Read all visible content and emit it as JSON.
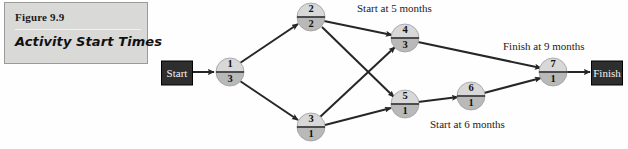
{
  "figure": {
    "number_label": "Figure 9.9",
    "title": "Activity Start Times"
  },
  "diagram": {
    "type": "activity-on-node-network",
    "terminals": [
      {
        "id": "start",
        "label": "Start",
        "x": 177,
        "y": 73,
        "width": 31,
        "height": 24
      },
      {
        "id": "finish",
        "label": "Finish",
        "x": 607,
        "y": 73,
        "width": 31,
        "height": 24
      }
    ],
    "nodes": [
      {
        "id": "n1",
        "top": "1",
        "bottom": "3",
        "cx": 230,
        "cy": 72,
        "r": 14
      },
      {
        "id": "n2",
        "top": "2",
        "bottom": "2",
        "cx": 311,
        "cy": 17,
        "r": 14
      },
      {
        "id": "n3",
        "top": "3",
        "bottom": "1",
        "cx": 311,
        "cy": 127,
        "r": 14
      },
      {
        "id": "n4",
        "top": "4",
        "bottom": "3",
        "cx": 405,
        "cy": 38,
        "r": 14
      },
      {
        "id": "n5",
        "top": "5",
        "bottom": "1",
        "cx": 405,
        "cy": 104,
        "r": 14
      },
      {
        "id": "n6",
        "top": "6",
        "bottom": "1",
        "cx": 471,
        "cy": 96,
        "r": 14
      },
      {
        "id": "n7",
        "top": "7",
        "bottom": "1",
        "cx": 553,
        "cy": 72,
        "r": 14
      }
    ],
    "edges": [
      {
        "from": "start",
        "to": "n1"
      },
      {
        "from": "n1",
        "to": "n2"
      },
      {
        "from": "n1",
        "to": "n3"
      },
      {
        "from": "n2",
        "to": "n4"
      },
      {
        "from": "n2",
        "to": "n5"
      },
      {
        "from": "n3",
        "to": "n4"
      },
      {
        "from": "n3",
        "to": "n5"
      },
      {
        "from": "n4",
        "to": "n7"
      },
      {
        "from": "n5",
        "to": "n6"
      },
      {
        "from": "n6",
        "to": "n7"
      },
      {
        "from": "n7",
        "to": "finish"
      }
    ],
    "annotations": [
      {
        "id": "ann-start-5",
        "text": "Start at 5 months",
        "x": 357,
        "y": 9
      },
      {
        "id": "ann-finish-9",
        "text": "Finish at 9 months",
        "x": 503,
        "y": 47
      },
      {
        "id": "ann-start-6",
        "text": "Start at 6 months",
        "x": 430,
        "y": 125
      }
    ]
  },
  "colors": {
    "caption_background": "#d9d9d7",
    "terminal_fill": "#2e2e2e",
    "node_top_fill": "#d8d8d8",
    "node_bottom_fill": "#b9b9b9",
    "edge_stroke": "#262626"
  }
}
